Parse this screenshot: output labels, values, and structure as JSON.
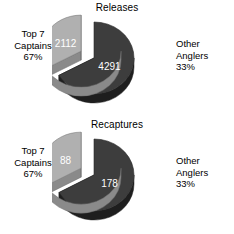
{
  "figure": {
    "background_color": "#ffffff",
    "text_color": "#000000"
  },
  "chart_data": [
    {
      "type": "pie",
      "title": "Releases",
      "categories": [
        "Top 7 Captains",
        "Other Anglers"
      ],
      "values": [
        4291,
        2112
      ],
      "percent_labels": [
        "67%",
        "33%"
      ],
      "value_labels": [
        "4291",
        "2112"
      ],
      "colors": [
        "#3d3d3d",
        "#b0b0b0"
      ],
      "side_colors": [
        "#1e1e1e",
        "#8a8a8a"
      ],
      "exploded": [
        false,
        true
      ],
      "legend": "none",
      "grid": false,
      "left_label": {
        "line1": "Top 7",
        "line2": "Captains",
        "line3": "67%"
      },
      "right_label": {
        "line1": "Other",
        "line2": "Anglers",
        "line3": "33%"
      }
    },
    {
      "type": "pie",
      "title": "Recaptures",
      "categories": [
        "Top 7 Captains",
        "Other Anglers"
      ],
      "values": [
        178,
        88
      ],
      "percent_labels": [
        "67%",
        "33%"
      ],
      "value_labels": [
        "178",
        "88"
      ],
      "colors": [
        "#3d3d3d",
        "#b0b0b0"
      ],
      "side_colors": [
        "#1e1e1e",
        "#8a8a8a"
      ],
      "exploded": [
        false,
        true
      ],
      "legend": "none",
      "grid": false,
      "left_label": {
        "line1": "Top 7",
        "line2": "Captains",
        "line3": "67%"
      },
      "right_label": {
        "line1": "Other",
        "line2": "Anglers",
        "line3": "33%"
      }
    }
  ]
}
